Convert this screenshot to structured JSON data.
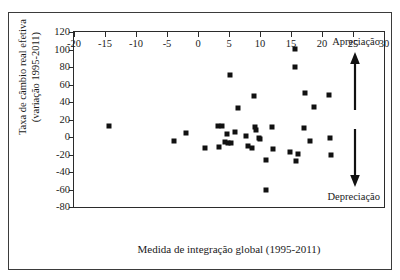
{
  "chart_data": {
    "type": "scatter",
    "title": "",
    "xlabel": "Medida de integração global (1995-2011)",
    "ylabel": "Taxa de câmbio real efetiva\n(variação 1995-2011)",
    "ylabel_line1": "Taxa de câmbio real efetiva",
    "ylabel_line2": "(variação 1995-2011)",
    "xlim": [
      -20,
      30
    ],
    "ylim": [
      -80,
      120
    ],
    "xticks": [
      -20,
      -15,
      -10,
      -5,
      0,
      5,
      10,
      15,
      20,
      25,
      30
    ],
    "xticklabels": [
      "-20",
      "-15",
      "-10",
      "-5",
      "0",
      "5",
      "10",
      "15",
      "20",
      "25",
      "30"
    ],
    "yticks": [
      -80,
      -60,
      -40,
      -20,
      0,
      20,
      40,
      60,
      80,
      100,
      120
    ],
    "yticklabels": [
      "-80",
      "-60",
      "-40",
      "-20",
      "0",
      "20",
      "40",
      "60",
      "80",
      "100",
      "120"
    ],
    "grid": false,
    "legend": null,
    "marker": "square",
    "marker_color": "#111111",
    "points": [
      {
        "x": -14.3,
        "y": 13
      },
      {
        "x": -3.9,
        "y": -5
      },
      {
        "x": -2.0,
        "y": 5
      },
      {
        "x": 1.2,
        "y": -12
      },
      {
        "x": 3.2,
        "y": 13
      },
      {
        "x": 3.4,
        "y": -11
      },
      {
        "x": 3.9,
        "y": 13
      },
      {
        "x": 4.3,
        "y": -6
      },
      {
        "x": 4.7,
        "y": 4
      },
      {
        "x": 4.9,
        "y": -7
      },
      {
        "x": 5.1,
        "y": 71
      },
      {
        "x": 5.3,
        "y": -7
      },
      {
        "x": 5.9,
        "y": 6
      },
      {
        "x": 6.4,
        "y": 33
      },
      {
        "x": 7.8,
        "y": 1
      },
      {
        "x": 8.1,
        "y": -10
      },
      {
        "x": 8.7,
        "y": -13
      },
      {
        "x": 9.1,
        "y": 47
      },
      {
        "x": 9.2,
        "y": 11
      },
      {
        "x": 9.4,
        "y": 8
      },
      {
        "x": 9.9,
        "y": -1
      },
      {
        "x": 10.0,
        "y": -2
      },
      {
        "x": 10.9,
        "y": -26
      },
      {
        "x": 11.0,
        "y": -60
      },
      {
        "x": 11.9,
        "y": 12
      },
      {
        "x": 12.1,
        "y": -14
      },
      {
        "x": 14.9,
        "y": -17
      },
      {
        "x": 15.6,
        "y": 101
      },
      {
        "x": 15.7,
        "y": 80
      },
      {
        "x": 15.8,
        "y": -27
      },
      {
        "x": 16.2,
        "y": -19
      },
      {
        "x": 17.1,
        "y": 10
      },
      {
        "x": 17.3,
        "y": 50
      },
      {
        "x": 18.1,
        "y": -5
      },
      {
        "x": 18.7,
        "y": 34
      },
      {
        "x": 21.1,
        "y": 48
      },
      {
        "x": 21.3,
        "y": -1
      },
      {
        "x": 21.5,
        "y": -20
      }
    ],
    "annotations": [
      {
        "name": "apreciacao",
        "text": "Apreciação",
        "position": "top-right",
        "arrow": "up"
      },
      {
        "name": "depreciacao",
        "text": "Depreciação",
        "position": "bottom-right",
        "arrow": "down"
      }
    ]
  }
}
